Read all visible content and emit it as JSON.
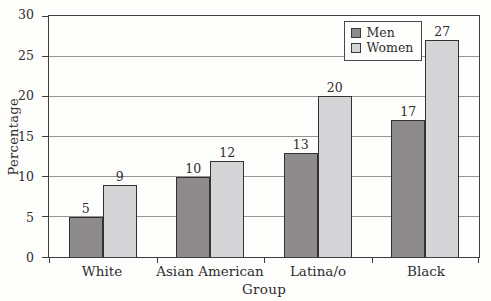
{
  "chart_data": {
    "type": "bar",
    "title": "",
    "categories": [
      "White",
      "Asian American",
      "Latina/o",
      "Black"
    ],
    "series": [
      {
        "name": "Men",
        "color": "#8e8b8c",
        "values": [
          5,
          10,
          13,
          17
        ]
      },
      {
        "name": "Women",
        "color": "#d5d4d6",
        "values": [
          9,
          12,
          20,
          27
        ]
      }
    ],
    "xlabel": "Group",
    "ylabel": "Percentage",
    "ylim": [
      0,
      30
    ],
    "yticks": [
      0,
      5,
      10,
      15,
      20,
      25,
      30
    ],
    "grid": "horizontal gridlines at each y tick, plot fully framed",
    "legend_position": "top-right inside plot area",
    "bar_labels": "value shown above each bar"
  },
  "colors": {
    "axis": "#3f3e3e",
    "gridline": "#979593",
    "bar_border": "#333132",
    "text": "#2f2d2e",
    "background": "#fdfdfc"
  }
}
